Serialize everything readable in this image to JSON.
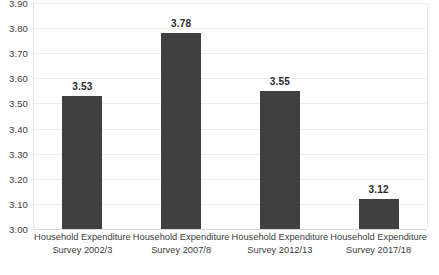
{
  "chart_data": {
    "type": "bar",
    "title": "",
    "xlabel": "",
    "ylabel": "",
    "categories": [
      "Household Expenditure Survey 2002/3",
      "Household Expenditure Survey 2007/8",
      "Household Expenditure Survey 2012/13",
      "Household Expenditure Survey 2017/18"
    ],
    "category_lines": [
      [
        "Household Expenditure",
        "Survey 2002/3"
      ],
      [
        "Household Expenditure",
        "Survey 2007/8"
      ],
      [
        "Household Expenditure",
        "Survey 2012/13"
      ],
      [
        "Household Expenditure",
        "Survey 2017/18"
      ]
    ],
    "values": [
      3.53,
      3.78,
      3.55,
      3.12
    ],
    "value_labels": [
      "3.53",
      "3.78",
      "3.55",
      "3.12"
    ],
    "ylim": [
      3.0,
      3.9
    ],
    "ytick_labels": [
      "3.90",
      "3.80",
      "3.70",
      "3.60",
      "3.50",
      "3.40",
      "3.30",
      "3.20",
      "3.10",
      "3.00"
    ],
    "ytick_values": [
      3.9,
      3.8,
      3.7,
      3.6,
      3.5,
      3.4,
      3.3,
      3.2,
      3.1,
      3.0
    ],
    "grid": true,
    "legend": false,
    "colors": {
      "bar": "#404040",
      "grid": "#ededed",
      "axis_text": "#3c3c3c",
      "value_text": "#2b2b2b",
      "background": "#ffffff",
      "frame": "#e3e3e3"
    }
  }
}
